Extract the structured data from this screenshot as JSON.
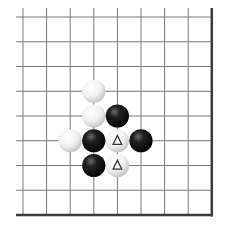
{
  "diagram": {
    "columns": 9,
    "rows": 9,
    "edges": [
      "right",
      "bottom"
    ],
    "colors": {
      "background": "#ffffff",
      "grid_line": "#7a7a7a",
      "edge_line": "#3a3a3a",
      "black_stone": "#111111",
      "white_stone": "#f4f4f4",
      "marker": "#333333"
    },
    "stones": [
      {
        "col": 3,
        "row": 3,
        "color": "white",
        "marker": ""
      },
      {
        "col": 3,
        "row": 4,
        "color": "white",
        "marker": ""
      },
      {
        "col": 4,
        "row": 4,
        "color": "black",
        "marker": ""
      },
      {
        "col": 2,
        "row": 5,
        "color": "white",
        "marker": ""
      },
      {
        "col": 3,
        "row": 5,
        "color": "black",
        "marker": ""
      },
      {
        "col": 4,
        "row": 5,
        "color": "white",
        "marker": "triangle"
      },
      {
        "col": 5,
        "row": 5,
        "color": "black",
        "marker": ""
      },
      {
        "col": 3,
        "row": 6,
        "color": "black",
        "marker": ""
      },
      {
        "col": 4,
        "row": 6,
        "color": "white",
        "marker": "triangle"
      }
    ]
  }
}
